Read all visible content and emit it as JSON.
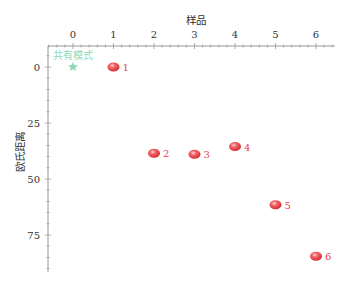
{
  "chart_data": {
    "type": "scatter",
    "title": "",
    "xlabel": "样品",
    "ylabel": "欧氏距离",
    "x_axis_position": "top",
    "y_axis_inverted": true,
    "xlim": [
      -0.6,
      6.7
    ],
    "ylim": [
      0,
      92
    ],
    "x_ticks": [
      0,
      1,
      2,
      3,
      4,
      5,
      6
    ],
    "y_ticks": [
      0,
      25,
      50,
      75
    ],
    "grid": false,
    "reference_point": {
      "label": "共有模式",
      "x": 0,
      "y": 0,
      "color": "#8fd9b6",
      "marker": "star"
    },
    "series": [
      {
        "name": "样品",
        "color": "#e8464a",
        "marker": "ellipse",
        "points": [
          {
            "label": "1",
            "x": 1,
            "y": 0
          },
          {
            "label": "2",
            "x": 2,
            "y": 38.5
          },
          {
            "label": "3",
            "x": 3,
            "y": 39
          },
          {
            "label": "4",
            "x": 4,
            "y": 35.5
          },
          {
            "label": "5",
            "x": 5,
            "y": 61.5
          },
          {
            "label": "6",
            "x": 6,
            "y": 84.5
          }
        ]
      }
    ]
  }
}
